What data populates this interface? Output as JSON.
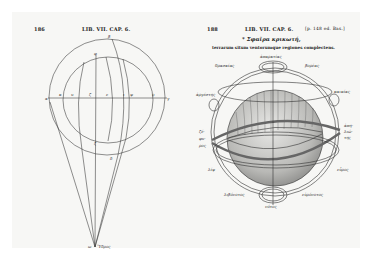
{
  "left_page": {
    "page_number": "186",
    "running_head": "LIB. VII. CAP. 6.",
    "figure": {
      "type": "projection-diagram",
      "point_labels": {
        "top": "β",
        "inner_top": "φ",
        "axis": [
          "α",
          "κ",
          "υ",
          "ζ",
          "ε",
          "ι",
          "ψ",
          "ϙ",
          "γ"
        ],
        "lower_inner": "ζ",
        "lower_outer": "δ",
        "apex": "ω",
        "apex_word": "Ὕδρος"
      }
    }
  },
  "right_page": {
    "page_number": "188",
    "running_head": "LIB. VII. CAP. 6.",
    "margin_note": "[p. 148 ed. Bas.]",
    "title": "* Σφαῖρα κρικωτή,",
    "subtitle": "terrarum situm ventorumque regiones complectens.",
    "figure": {
      "type": "armillary-sphere",
      "wind_labels": {
        "top": "ἀπαρκτίας",
        "upper_left": "θρασκίας",
        "upper_right": "βορέας",
        "mid_left": "ἀργέστης",
        "mid_right": "καικίας",
        "left": "ζέφυρος",
        "right": "ἀπηλιώτης",
        "lower_left": "λίψ",
        "lower_right": "εὖρος",
        "bottom_left": "λιβόνοτος",
        "bottom_right": "εὐρόνοτος",
        "bottom": "νότος"
      }
    }
  }
}
